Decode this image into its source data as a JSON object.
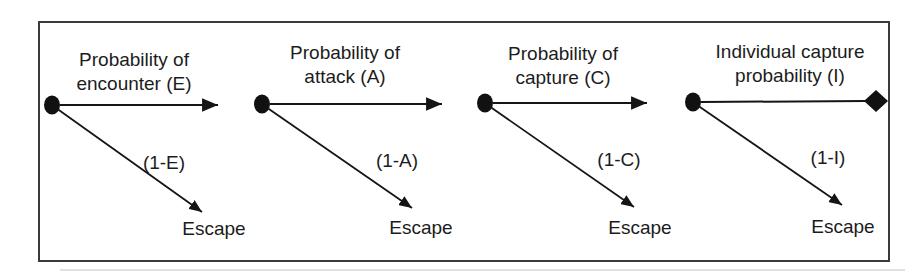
{
  "figure": {
    "description_labels": {
      "escape": "Escape"
    }
  },
  "colors": {
    "ink": "#1c1c1c",
    "border": "#3a3a3a",
    "background": "#ffffff"
  },
  "stages": [
    {
      "title_line1": "Probability of",
      "title_line2": "encounter (E)",
      "branch_label": "(1-E)",
      "escape_label": "Escape",
      "start_marker": "dot",
      "end_marker": "arrowhead"
    },
    {
      "title_line1": "Probability of",
      "title_line2": "attack (A)",
      "branch_label": "(1-A)",
      "escape_label": "Escape",
      "start_marker": "dot",
      "end_marker": "arrowhead"
    },
    {
      "title_line1": "Probability of",
      "title_line2": "capture (C)",
      "branch_label": "(1-C)",
      "escape_label": "Escape",
      "start_marker": "dot",
      "end_marker": "arrowhead"
    },
    {
      "title_line1": "Individual capture",
      "title_line2": "probability (I)",
      "branch_label": "(1-I)",
      "escape_label": "Escape",
      "start_marker": "dot",
      "end_marker": "diamond"
    }
  ]
}
